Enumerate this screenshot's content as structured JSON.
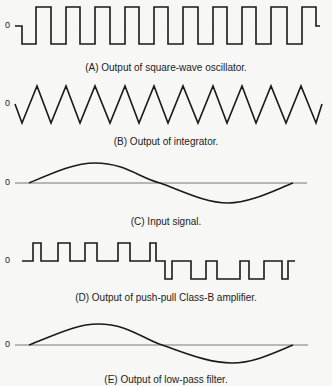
{
  "figure": {
    "panels": [
      {
        "id": "A",
        "caption": "(A) Output of square-wave oscillator.",
        "zero_label": "0",
        "waveform": "square"
      },
      {
        "id": "B",
        "caption": "(B) Output of integrator.",
        "zero_label": "0",
        "waveform": "triangle"
      },
      {
        "id": "C",
        "caption": "(C) Input signal.",
        "zero_label": "0",
        "waveform": "sine"
      },
      {
        "id": "D",
        "caption": "(D) Output of push-pull Class-B amplifier.",
        "zero_label": "0",
        "waveform": "pwm"
      },
      {
        "id": "E",
        "caption": "(E) Output of low-pass filter.",
        "zero_label": "0",
        "waveform": "sine"
      }
    ],
    "colors": {
      "stroke": "#1a1a1a",
      "axis": "#555555",
      "background": "#f7f7f5"
    }
  }
}
